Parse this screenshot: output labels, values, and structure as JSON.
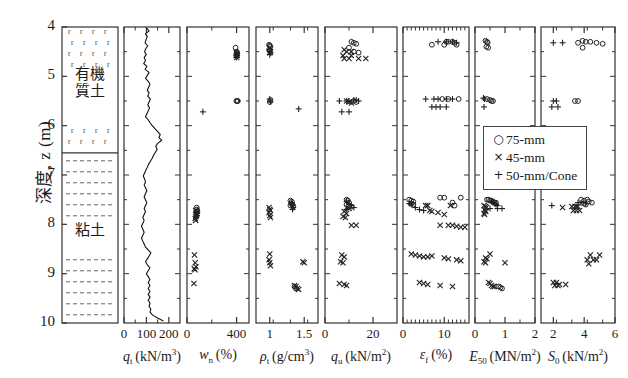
{
  "figure": {
    "y_axis_label": "深度, z (m)",
    "y_ticks": [
      4,
      5,
      6,
      7,
      8,
      9,
      10
    ],
    "y_range": [
      4,
      10
    ]
  },
  "soil_column": {
    "layers": [
      {
        "name": "有機質土",
        "top": 4.0,
        "bottom": 6.55,
        "pattern": "peat-r"
      },
      {
        "name": "粘土",
        "top": 6.55,
        "bottom": 10.0,
        "pattern": "clay-dash"
      }
    ]
  },
  "legend": {
    "position": "overlapping E50 and S0 panels",
    "items": [
      {
        "symbol": "circle",
        "glyph": "○",
        "label": "75-mm"
      },
      {
        "symbol": "cross",
        "glyph": "×",
        "label": "45-mm"
      },
      {
        "symbol": "plus",
        "glyph": "+",
        "label": "50-mm/Cone"
      }
    ]
  },
  "chart_data": [
    {
      "type": "line",
      "panel": 1,
      "title": "",
      "xlabel": "q_t (kN/m³)",
      "xlabel_sym": "q",
      "xlabel_sub": "t",
      "xlabel_unit": "(kN/m",
      "ylabel": "深度, z (m)",
      "xlim": [
        0,
        250
      ],
      "ylim": [
        4,
        10
      ],
      "xticks": [
        0,
        100,
        200
      ],
      "xticklabels": [
        "0",
        "100",
        "200"
      ],
      "grid": false,
      "series": [
        {
          "name": "qt profile",
          "points_y": [
            4.02,
            4.08,
            4.14,
            4.2,
            4.26,
            4.32,
            4.38,
            4.44,
            4.5,
            4.56,
            4.62,
            4.68,
            4.74,
            4.8,
            4.86,
            4.92,
            4.98,
            5.04,
            5.1,
            5.16,
            5.22,
            5.28,
            5.34,
            5.4,
            5.46,
            5.52,
            5.58,
            5.64,
            5.7,
            5.76,
            5.82,
            5.88,
            5.94,
            6.0,
            6.06,
            6.12,
            6.18,
            6.24,
            6.3,
            6.36,
            6.42,
            6.48,
            6.54,
            6.6,
            6.66,
            6.72,
            6.78,
            6.84,
            6.9,
            6.96,
            7.02,
            7.08,
            7.14,
            7.2,
            7.26,
            7.32,
            7.38,
            7.44,
            7.5,
            7.56,
            7.62,
            7.68,
            7.74,
            7.8,
            7.86,
            7.92,
            7.98,
            8.04,
            8.1,
            8.16,
            8.22,
            8.28,
            8.34,
            8.4,
            8.46,
            8.52,
            8.58,
            8.64,
            8.7,
            8.76,
            8.82,
            8.88,
            8.94,
            9.0,
            9.06,
            9.12,
            9.18,
            9.24,
            9.3,
            9.36,
            9.42,
            9.48,
            9.54,
            9.6,
            9.66,
            9.72,
            9.78,
            9.84,
            9.9,
            9.96
          ],
          "points_x": [
            100,
            112,
            96,
            104,
            98,
            94,
            106,
            97,
            92,
            99,
            90,
            96,
            88,
            102,
            94,
            112,
            104,
            96,
            108,
            116,
            110,
            104,
            112,
            106,
            118,
            112,
            106,
            114,
            108,
            102,
            96,
            108,
            116,
            126,
            138,
            150,
            162,
            156,
            168,
            150,
            142,
            148,
            140,
            132,
            126,
            118,
            110,
            104,
            98,
            92,
            86,
            92,
            96,
            90,
            96,
            102,
            96,
            90,
            96,
            102,
            96,
            90,
            96,
            90,
            84,
            90,
            84,
            78,
            84,
            90,
            84,
            78,
            84,
            90,
            96,
            108,
            120,
            112,
            104,
            96,
            104,
            116,
            108,
            100,
            108,
            116,
            108,
            116,
            108,
            116,
            108,
            116,
            108,
            116,
            112,
            120,
            116,
            128,
            150,
            176
          ]
        }
      ]
    },
    {
      "type": "scatter",
      "panel": 2,
      "xlabel": "w_n (%)",
      "xlabel_sym": "w",
      "xlabel_sub": "n",
      "xlabel_unit": "(%)",
      "xlim": [
        0,
        500
      ],
      "ylim": [
        4,
        10
      ],
      "xticks": [
        0,
        400
      ],
      "xticklabels": [
        "0",
        "400"
      ],
      "series": [
        {
          "name": "75-mm",
          "symbol": "circle",
          "x": [
            392,
            400,
            404,
            402,
            398,
            398,
            406,
            410,
            78,
            80,
            84
          ],
          "y": [
            4.42,
            4.5,
            4.52,
            4.56,
            4.58,
            5.5,
            5.5,
            5.5,
            7.66,
            7.7,
            7.74
          ]
        },
        {
          "name": "45-mm",
          "symbol": "cross",
          "x": [
            398,
            402,
            406,
            400,
            70,
            74,
            78,
            72,
            66,
            70,
            76,
            60,
            66,
            72,
            58,
            64,
            56
          ],
          "y": [
            4.52,
            4.56,
            4.58,
            4.62,
            7.72,
            7.76,
            7.8,
            7.84,
            7.88,
            7.92,
            7.78,
            8.62,
            8.78,
            8.86,
            8.9,
            8.92,
            9.2
          ]
        },
        {
          "name": "50-mm/Cone",
          "symbol": "plus",
          "x": [
            400,
            404,
            398,
            128,
            76,
            82,
            80,
            74
          ],
          "y": [
            4.54,
            4.58,
            4.62,
            5.72,
            7.74,
            7.78,
            7.82,
            7.86
          ]
        }
      ]
    },
    {
      "type": "scatter",
      "panel": 3,
      "xlabel": "ρ_t (g/cm³)",
      "xlabel_sym": "ρ",
      "xlabel_sub": "t",
      "xlabel_unit": "(g/cm",
      "xlim": [
        0.8,
        1.7
      ],
      "ylim": [
        4,
        10
      ],
      "xticks": [
        1,
        1.5
      ],
      "xticklabels": [
        "1",
        "1.5"
      ],
      "series": [
        {
          "name": "75-mm",
          "symbol": "circle",
          "x": [
            0.99,
            1.0,
            1.01,
            0.99,
            1.0,
            1.01,
            1.0,
            1.3,
            1.32,
            1.31,
            1.33,
            1.3,
            1.34,
            1.36,
            1.38
          ],
          "y": [
            4.36,
            4.38,
            4.4,
            4.46,
            4.48,
            5.48,
            5.52,
            7.52,
            7.54,
            7.58,
            7.6,
            7.62,
            7.64,
            9.26,
            9.3
          ]
        },
        {
          "name": "45-mm",
          "symbol": "cross",
          "x": [
            1.0,
            1.01,
            1.0,
            0.99,
            1.0,
            1.01,
            0.99,
            1.0,
            1.01,
            1.0,
            0.99,
            1.0,
            1.01,
            1.48,
            1.5,
            1.36,
            1.38,
            1.4,
            1.42
          ],
          "y": [
            4.42,
            4.5,
            4.52,
            7.66,
            7.7,
            7.72,
            7.76,
            7.82,
            7.86,
            8.6,
            8.72,
            8.78,
            8.84,
            8.76,
            8.78,
            9.24,
            9.26,
            9.3,
            9.32
          ]
        },
        {
          "name": "50-mm/Cone",
          "symbol": "plus",
          "x": [
            1.0,
            1.01,
            1.0,
            1.0,
            1.01,
            1.42,
            1.32,
            1.33,
            1.34,
            1.33
          ],
          "y": [
            4.5,
            4.52,
            4.56,
            5.46,
            5.52,
            5.66,
            7.56,
            7.6,
            7.66,
            7.7
          ]
        }
      ]
    },
    {
      "type": "scatter",
      "panel": 4,
      "xlabel": "q_u (kN/m²)",
      "xlabel_sym": "q",
      "xlabel_sub": "u",
      "xlabel_unit": "(kN/m",
      "xlim": [
        0,
        30
      ],
      "ylim": [
        4,
        10
      ],
      "xticks": [
        0,
        20
      ],
      "xticklabels": [
        "0",
        "20"
      ],
      "series": [
        {
          "name": "75-mm",
          "symbol": "circle",
          "x": [
            11,
            12,
            13,
            10,
            12,
            14,
            12,
            13,
            9,
            9.5,
            10,
            9,
            10,
            11
          ],
          "y": [
            4.3,
            4.32,
            4.34,
            4.42,
            4.5,
            4.52,
            5.5,
            5.52,
            7.5,
            7.52,
            7.56,
            7.6,
            7.62,
            7.64
          ]
        },
        {
          "name": "45-mm",
          "symbol": "cross",
          "x": [
            8,
            9,
            11,
            7.5,
            11,
            8,
            10,
            14,
            17,
            9,
            10,
            11,
            9,
            10,
            8,
            9,
            7.5,
            8.5,
            11,
            13,
            7,
            8,
            6.5,
            7.5,
            6,
            8,
            9
          ],
          "y": [
            4.46,
            4.5,
            4.5,
            4.58,
            4.58,
            4.64,
            4.64,
            4.64,
            4.64,
            5.5,
            5.52,
            5.54,
            7.66,
            7.68,
            7.74,
            7.78,
            7.84,
            7.86,
            8.02,
            8.02,
            8.62,
            8.66,
            8.76,
            8.78,
            9.2,
            9.22,
            9.24
          ]
        },
        {
          "name": "50-mm/Cone",
          "symbol": "plus",
          "x": [
            6,
            9,
            10,
            12,
            13,
            14,
            7,
            10,
            9,
            10,
            11,
            12,
            9
          ],
          "y": [
            5.5,
            5.5,
            5.5,
            5.48,
            5.48,
            5.5,
            5.72,
            5.72,
            7.54,
            7.58,
            7.62,
            7.66,
            7.7
          ]
        }
      ]
    },
    {
      "type": "scatter",
      "panel": 5,
      "xlabel": "ε_f (%)",
      "xlabel_sym": "ε",
      "xlabel_sub": "f",
      "xlabel_unit": "(%)",
      "xlim": [
        0,
        16
      ],
      "ylim": [
        4,
        10
      ],
      "xticks": [
        0,
        10
      ],
      "xticklabels": [
        "0",
        "10"
      ],
      "minor_ticks": true,
      "series": [
        {
          "name": "75-mm",
          "symbol": "circle",
          "x": [
            7,
            10.5,
            11,
            12,
            12.5,
            10,
            13,
            9.5,
            11,
            13.5,
            1.5,
            2,
            2.5,
            9,
            10,
            14,
            2,
            2.5,
            12,
            12.5
          ],
          "y": [
            4.36,
            4.3,
            4.3,
            4.3,
            4.32,
            4.36,
            4.36,
            5.46,
            5.46,
            5.46,
            7.5,
            7.52,
            7.54,
            7.46,
            7.46,
            7.46,
            7.58,
            7.6,
            7.56,
            7.62
          ]
        },
        {
          "name": "45-mm",
          "symbol": "cross",
          "x": [
            5.5,
            6,
            11.5,
            6.5,
            7,
            8.5,
            10,
            9,
            11,
            12,
            13,
            14,
            15,
            2,
            3,
            4,
            5,
            6,
            7,
            4,
            5,
            6,
            9,
            12,
            10,
            11,
            13,
            14
          ],
          "y": [
            7.62,
            7.62,
            7.62,
            7.72,
            7.74,
            7.76,
            7.8,
            8.02,
            8.02,
            8.02,
            8.04,
            8.06,
            8.06,
            8.6,
            8.62,
            8.64,
            8.66,
            8.66,
            8.64,
            9.18,
            9.2,
            9.22,
            9.24,
            9.26,
            8.68,
            8.7,
            8.72,
            8.74
          ]
        },
        {
          "name": "50-mm/Cone",
          "symbol": "plus",
          "x": [
            8.5,
            10.5,
            12,
            13,
            5.5,
            7.5,
            8.5,
            10.5,
            12,
            7,
            8,
            9,
            10.5,
            1.5,
            2,
            3,
            4,
            5
          ],
          "y": [
            4.3,
            4.3,
            4.3,
            4.32,
            5.46,
            5.46,
            5.46,
            5.46,
            5.46,
            5.62,
            5.62,
            5.62,
            5.62,
            7.58,
            7.6,
            7.66,
            7.7,
            7.72
          ]
        }
      ]
    },
    {
      "type": "scatter",
      "panel": 6,
      "xlabel": "E_50 (MN/m²)",
      "xlabel_sym": "E",
      "xlabel_sub": "50",
      "xlabel_unit": "(MN/m",
      "xlim": [
        0,
        2
      ],
      "ylim": [
        4,
        10
      ],
      "xticks": [
        0,
        1,
        2
      ],
      "xticklabels": [
        "0",
        "1",
        "2"
      ],
      "series": [
        {
          "name": "75-mm",
          "symbol": "circle",
          "x": [
            0.35,
            0.4,
            0.42,
            0.38,
            0.44,
            0.4,
            0.5,
            0.55,
            0.6,
            0.4,
            0.45,
            0.5,
            0.55,
            0.6,
            0.65,
            0.7,
            0.8,
            0.85,
            0.9
          ],
          "y": [
            4.28,
            4.3,
            4.32,
            4.4,
            4.42,
            5.46,
            5.48,
            5.5,
            5.5,
            7.5,
            7.5,
            7.52,
            7.52,
            7.54,
            7.56,
            7.56,
            9.26,
            9.28,
            9.3
          ]
        },
        {
          "name": "45-mm",
          "symbol": "cross",
          "x": [
            0.3,
            0.35,
            0.38,
            0.32,
            0.34,
            0.36,
            0.3,
            0.32,
            0.5,
            0.35,
            0.4,
            0.3,
            0.35,
            0.45,
            0.5,
            1.0,
            0.55,
            0.6,
            0.65
          ],
          "y": [
            7.62,
            7.64,
            7.66,
            7.7,
            7.72,
            7.74,
            7.78,
            7.8,
            8.6,
            8.68,
            8.7,
            8.76,
            8.78,
            9.18,
            9.2,
            8.78,
            9.24,
            9.26,
            9.26
          ]
        },
        {
          "name": "50-mm/Cone",
          "symbol": "plus",
          "x": [
            0.28,
            0.32,
            0.3,
            0.55,
            0.6,
            0.65,
            0.7,
            0.75,
            0.5,
            0.75,
            0.9
          ],
          "y": [
            5.44,
            5.46,
            5.62,
            7.54,
            7.56,
            7.58,
            7.6,
            7.62,
            7.68,
            7.68,
            7.68
          ]
        }
      ]
    },
    {
      "type": "scatter",
      "panel": 7,
      "xlabel": "S_0 (kN/m²)",
      "xlabel_sym": "S",
      "xlabel_sub": "0",
      "xlabel_unit": "(kN/m",
      "xlim": [
        1.2,
        6
      ],
      "ylim": [
        4,
        10
      ],
      "xticks": [
        2,
        4,
        6
      ],
      "xticklabels": [
        "2",
        "4",
        "6"
      ],
      "series": [
        {
          "name": "75-mm",
          "symbol": "circle",
          "x": [
            3.6,
            3.9,
            4.1,
            4.4,
            4.8,
            5.2,
            3.9,
            3.4,
            3.6,
            3.8,
            4.0,
            4.2,
            4.3,
            4.5,
            4.0,
            4.1
          ],
          "y": [
            4.32,
            4.28,
            4.3,
            4.3,
            4.32,
            4.34,
            4.42,
            5.5,
            5.5,
            7.5,
            7.52,
            7.5,
            7.54,
            7.56,
            7.58,
            7.6
          ]
        },
        {
          "name": "45-mm",
          "symbol": "cross",
          "x": [
            2.6,
            3.2,
            3.4,
            3.5,
            3.6,
            3.3,
            3.5,
            3.7,
            4.4,
            5.0,
            4.2,
            4.6,
            4.8,
            4.3,
            2.0,
            2.2,
            2.4,
            2.1,
            2.3,
            2.8
          ],
          "y": [
            7.66,
            7.64,
            7.64,
            7.64,
            7.64,
            7.72,
            7.72,
            7.72,
            8.62,
            8.62,
            8.72,
            8.72,
            8.72,
            8.8,
            9.18,
            9.18,
            9.22,
            9.24,
            9.24,
            9.22
          ]
        },
        {
          "name": "50-mm/Cone",
          "symbol": "plus",
          "x": [
            2.0,
            2.6,
            2.0,
            2.2,
            1.9,
            2.3,
            3.6,
            3.8,
            4.1,
            1.9
          ],
          "y": [
            4.32,
            4.32,
            5.5,
            5.5,
            5.62,
            5.62,
            7.56,
            7.56,
            7.58,
            7.62
          ]
        }
      ]
    }
  ]
}
